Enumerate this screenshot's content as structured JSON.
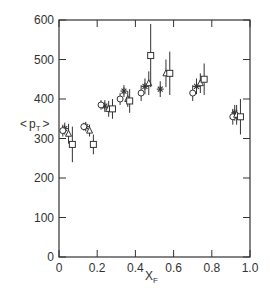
{
  "chart_data": {
    "type": "scatter",
    "title": "",
    "xlabel": "X_F",
    "ylabel": "<p_T>",
    "xlim": [
      0,
      1.0
    ],
    "ylim": [
      0,
      600
    ],
    "x_ticks": [
      "0",
      "0.2",
      "0.4",
      "0.6",
      "0.8",
      "1.0"
    ],
    "y_ticks": [
      "0",
      "100",
      "200",
      "300",
      "400",
      "500",
      "600"
    ],
    "grid": false,
    "legend": "none",
    "marker_series": [
      {
        "name": "star",
        "marker": "asterisk",
        "points": [
          {
            "x": 0.03,
            "y": 325,
            "err": 15
          },
          {
            "x": 0.14,
            "y": 330,
            "err": 12
          },
          {
            "x": 0.24,
            "y": 382,
            "err": 15
          },
          {
            "x": 0.34,
            "y": 420,
            "err": 15
          },
          {
            "x": 0.45,
            "y": 432,
            "err": 20
          },
          {
            "x": 0.53,
            "y": 425,
            "err": 20
          },
          {
            "x": 0.72,
            "y": 432,
            "err": 20
          },
          {
            "x": 0.92,
            "y": 365,
            "err": 20
          }
        ]
      },
      {
        "name": "circle",
        "marker": "circle",
        "points": [
          {
            "x": 0.02,
            "y": 320,
            "err": 15
          },
          {
            "x": 0.13,
            "y": 330,
            "err": 10
          },
          {
            "x": 0.22,
            "y": 385,
            "err": 12
          },
          {
            "x": 0.32,
            "y": 400,
            "err": 15
          },
          {
            "x": 0.43,
            "y": 415,
            "err": 20
          },
          {
            "x": 0.7,
            "y": 415,
            "err": 20
          },
          {
            "x": 0.91,
            "y": 355,
            "err": 20
          }
        ]
      },
      {
        "name": "triangle",
        "marker": "triangle",
        "points": [
          {
            "x": 0.05,
            "y": 312,
            "err": 25
          },
          {
            "x": 0.16,
            "y": 320,
            "err": 15
          },
          {
            "x": 0.26,
            "y": 375,
            "err": 20
          },
          {
            "x": 0.36,
            "y": 400,
            "err": 20
          },
          {
            "x": 0.47,
            "y": 440,
            "err": 30
          },
          {
            "x": 0.56,
            "y": 465,
            "err": 35
          },
          {
            "x": 0.74,
            "y": 440,
            "err": 25
          },
          {
            "x": 0.93,
            "y": 360,
            "err": 25
          }
        ]
      },
      {
        "name": "square",
        "marker": "square",
        "points": [
          {
            "x": 0.07,
            "y": 285,
            "err": 45
          },
          {
            "x": 0.18,
            "y": 285,
            "err": 25
          },
          {
            "x": 0.28,
            "y": 375,
            "err": 25
          },
          {
            "x": 0.37,
            "y": 395,
            "err": 30
          },
          {
            "x": 0.48,
            "y": 510,
            "err": 80
          },
          {
            "x": 0.58,
            "y": 465,
            "err": 55
          },
          {
            "x": 0.76,
            "y": 450,
            "err": 40
          },
          {
            "x": 0.95,
            "y": 355,
            "err": 45
          }
        ]
      }
    ]
  },
  "axes": {
    "xlabel_main": "X",
    "xlabel_sub": "F",
    "ylabel_open": "<",
    "ylabel_main": "p",
    "ylabel_sub": "T",
    "ylabel_close": ">"
  },
  "colors": {
    "ink": "#333333",
    "background": "#ffffff"
  }
}
